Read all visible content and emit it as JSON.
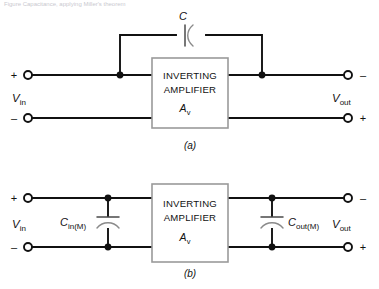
{
  "figure": {
    "top_partial_text": "Figure  Capacitance, applying Miller's theorem",
    "sub_captions": {
      "a": "(a)",
      "b": "(b)"
    }
  },
  "diagram_a": {
    "name": "Inverting amplifier with feedback capacitor",
    "feedback_capacitor": {
      "label": "C",
      "symbol": "capacitor-vertical-plates"
    },
    "amplifier": {
      "line1": "INVERTING",
      "line2": "AMPLIFIER",
      "gain_symbol": "A",
      "gain_subscript": "v"
    },
    "input": {
      "label_main": "V",
      "label_sub": "in",
      "top_sign": "+",
      "bottom_sign": "–"
    },
    "output": {
      "label_main": "V",
      "label_sub": "out",
      "top_sign": "–",
      "bottom_sign": "+"
    },
    "junction_count": 2
  },
  "diagram_b": {
    "name": "Miller equivalent with input and output shunt capacitances",
    "input_capacitor": {
      "label_main": "C",
      "label_sub": "in(M)",
      "symbol": "capacitor-horizontal-plates"
    },
    "output_capacitor": {
      "label_main": "C",
      "label_sub": "out(M)",
      "symbol": "capacitor-horizontal-plates"
    },
    "amplifier": {
      "line1": "INVERTING",
      "line2": "AMPLIFIER",
      "gain_symbol": "A",
      "gain_subscript": "v"
    },
    "input": {
      "label_main": "V",
      "label_sub": "in",
      "top_sign": "+",
      "bottom_sign": "–"
    },
    "output": {
      "label_main": "V",
      "label_sub": "out",
      "top_sign": "–",
      "bottom_sign": "+"
    },
    "junction_count": 4
  },
  "colors": {
    "wire": "#111111",
    "amplifier_border": "#9a9a9a",
    "capacitor_plate": "#4a4a4a",
    "background": "#ffffff",
    "text": "#111111"
  }
}
